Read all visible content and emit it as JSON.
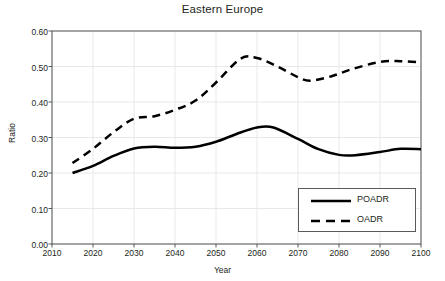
{
  "chart_data": {
    "type": "line",
    "title": "Eastern Europe",
    "xlabel": "Year",
    "ylabel": "Ratio",
    "xlim": [
      2010,
      2100
    ],
    "ylim": [
      0.0,
      0.6
    ],
    "xticks": [
      "2010",
      "2020",
      "2030",
      "2040",
      "2050",
      "2060",
      "2070",
      "2080",
      "2090",
      "2100"
    ],
    "yticks": [
      "0.00",
      "0.10",
      "0.20",
      "0.30",
      "0.40",
      "0.50",
      "0.60"
    ],
    "grid": true,
    "legend_position": "lower right",
    "series": [
      {
        "name": "POADR",
        "style": "solid",
        "color": "#000000",
        "x": [
          2015,
          2020,
          2025,
          2030,
          2035,
          2040,
          2045,
          2050,
          2055,
          2060,
          2064,
          2070,
          2075,
          2080,
          2084,
          2090,
          2095,
          2100
        ],
        "values": [
          0.2,
          0.22,
          0.248,
          0.269,
          0.274,
          0.271,
          0.274,
          0.288,
          0.31,
          0.328,
          0.328,
          0.296,
          0.267,
          0.251,
          0.25,
          0.259,
          0.268,
          0.267
        ]
      },
      {
        "name": "OADR",
        "style": "dashed",
        "color": "#000000",
        "x": [
          2015,
          2020,
          2025,
          2030,
          2035,
          2040,
          2045,
          2050,
          2056,
          2060,
          2065,
          2070,
          2073,
          2078,
          2083,
          2090,
          2095,
          2100
        ],
        "values": [
          0.228,
          0.268,
          0.315,
          0.353,
          0.36,
          0.378,
          0.404,
          0.455,
          0.522,
          0.524,
          0.5,
          0.47,
          0.46,
          0.472,
          0.492,
          0.513,
          0.515,
          0.512
        ]
      }
    ]
  },
  "legend": {
    "entries": [
      {
        "label": "POADR"
      },
      {
        "label": "OADR"
      }
    ]
  },
  "colors": {
    "line": "#000000",
    "axis": "#58595b",
    "grid": "#e8e8ea",
    "text": "#231f20",
    "background": "#ffffff"
  }
}
